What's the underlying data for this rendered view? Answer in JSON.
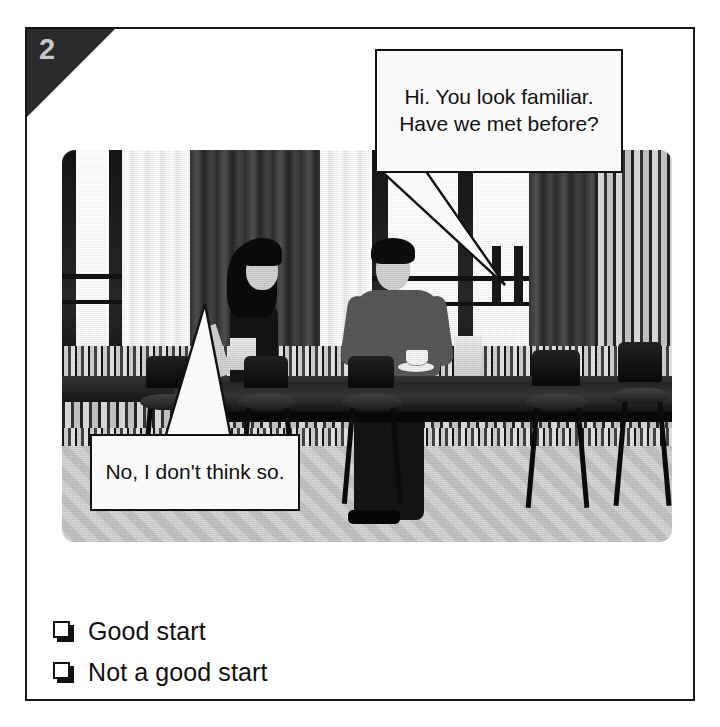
{
  "exercise": {
    "number": "2",
    "corner_tab_color": "#2b2b2d",
    "number_color": "#c9c9c9"
  },
  "photo": {
    "alt_description": "Black and white photograph of a woman and a man sitting at a long table in a cafe with tall curtained windows, patterned tiled walls and a herringbone floor",
    "style": "grayscale"
  },
  "speech_bubbles": [
    {
      "speaker": "man",
      "text": "Hi. You look familiar. Have we met before?",
      "lines": [
        "Hi. You look",
        "familiar. Have we",
        "met before?"
      ]
    },
    {
      "speaker": "woman",
      "text": "No, I don't think so.",
      "lines": [
        "No, I don’t",
        "think so."
      ]
    }
  ],
  "options": [
    {
      "label": "Good start",
      "checked": false
    },
    {
      "label": "Not a good start",
      "checked": false
    }
  ]
}
